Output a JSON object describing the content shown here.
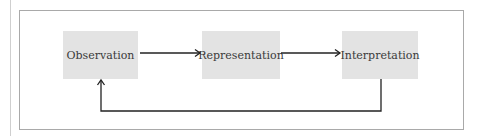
{
  "diagram": {
    "nodes": [
      {
        "id": "observation",
        "label": "Observation"
      },
      {
        "id": "representation",
        "label": "Representation"
      },
      {
        "id": "interpretation",
        "label": "Interpretation"
      }
    ],
    "edges": [
      {
        "from": "observation",
        "to": "representation"
      },
      {
        "from": "representation",
        "to": "interpretation"
      },
      {
        "from": "interpretation",
        "to": "observation",
        "type": "feedback"
      }
    ],
    "colors": {
      "box_fill": "#e3e3e3",
      "line": "#222222",
      "frame": "#a9a9a9"
    }
  }
}
